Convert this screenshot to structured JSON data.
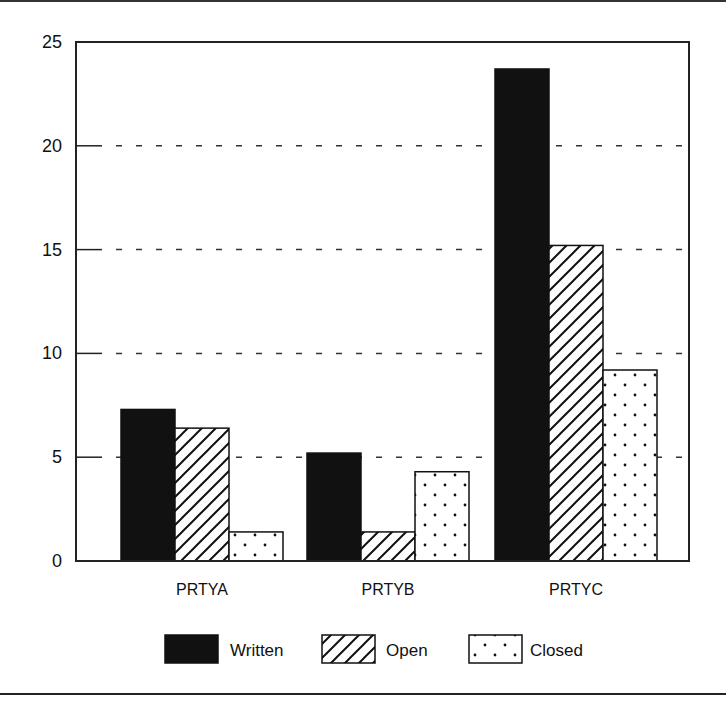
{
  "chart_data": {
    "type": "bar",
    "title": "",
    "xlabel": "",
    "ylabel": "",
    "ylim": [
      0,
      25
    ],
    "yticks": [
      0,
      5,
      10,
      15,
      20,
      25
    ],
    "grid": "dashed horizontal at 5, 10, 15, 20",
    "legend_position": "bottom",
    "categories": [
      "PRTYA",
      "PRTYB",
      "PRTYC"
    ],
    "series": [
      {
        "name": "Written",
        "pattern": "solid-black",
        "values": [
          7.3,
          5.2,
          23.7
        ]
      },
      {
        "name": "Open",
        "pattern": "diagonal-hatch",
        "values": [
          6.4,
          1.4,
          15.2
        ]
      },
      {
        "name": "Closed",
        "pattern": "dots",
        "values": [
          1.4,
          4.3,
          9.2
        ]
      }
    ]
  },
  "colors": {
    "ink": "#111111",
    "background": "#ffffff"
  }
}
